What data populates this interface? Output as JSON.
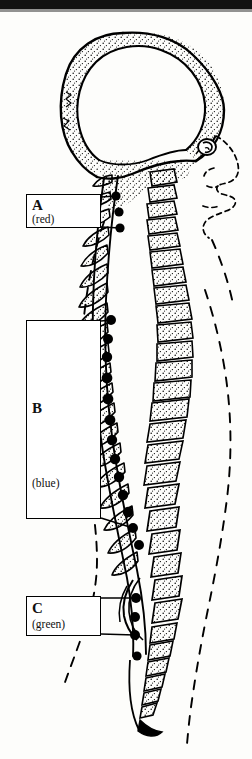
{
  "figure": {
    "kind": "anatomical-line-drawing",
    "view": "lateral / sagittal profile",
    "background_color": "#fdfdfb",
    "ink_color": "#000000"
  },
  "scan_artifact": {
    "name": "top-black-bar",
    "color": "#121212"
  },
  "labels": [
    {
      "id": "A",
      "letter": "A",
      "color_word": "(red)",
      "color_hex": "#cc0000",
      "region": "cervical",
      "box": {
        "x": 26,
        "y": 194,
        "w": 75,
        "h": 34
      },
      "leader_lines": 2,
      "marker_dots": 3
    },
    {
      "id": "B",
      "letter": "B",
      "color_word": "(blue)",
      "color_hex": "#0033cc",
      "region": "thoracic",
      "box": {
        "x": 26,
        "y": 320,
        "w": 75,
        "h": 199
      },
      "leader_lines": 2,
      "marker_dots": 12
    },
    {
      "id": "C",
      "letter": "C",
      "color_word": "(green)",
      "color_hex": "#008000",
      "region": "lumbar",
      "box": {
        "x": 26,
        "y": 596,
        "w": 75,
        "h": 40
      },
      "leader_lines": 2,
      "marker_dots": 3
    }
  ],
  "anatomy_parts": [
    {
      "name": "skull-cranium",
      "style": "stippled double outline"
    },
    {
      "name": "face-profile",
      "style": "dashed outline"
    },
    {
      "name": "ear",
      "style": "solid outline"
    },
    {
      "name": "vertebral-bodies",
      "style": "stippled blocks"
    },
    {
      "name": "spinous-processes",
      "style": "stippled wedges"
    },
    {
      "name": "spinal-cord-canal",
      "style": "pale band"
    },
    {
      "name": "spinal-nerve-dots",
      "style": "filled black circles"
    },
    {
      "name": "sacrum-coccyx",
      "style": "tapering stippled blocks"
    },
    {
      "name": "body-outline-back",
      "style": "dashed line"
    },
    {
      "name": "body-outline-front",
      "style": "dashed line"
    }
  ],
  "spinal_cord_dots": [
    {
      "x": 116,
      "y": 196,
      "r": 4.6
    },
    {
      "x": 119,
      "y": 212,
      "r": 4.6
    },
    {
      "x": 120,
      "y": 228,
      "r": 4.6
    },
    {
      "x": 111,
      "y": 320,
      "r": 5.0
    },
    {
      "x": 108,
      "y": 339,
      "r": 5.0
    },
    {
      "x": 107,
      "y": 357,
      "r": 5.2
    },
    {
      "x": 107,
      "y": 378,
      "r": 5.4
    },
    {
      "x": 108,
      "y": 399,
      "r": 5.4
    },
    {
      "x": 110,
      "y": 420,
      "r": 5.4
    },
    {
      "x": 112,
      "y": 440,
      "r": 5.2
    },
    {
      "x": 115,
      "y": 459,
      "r": 5.2
    },
    {
      "x": 119,
      "y": 477,
      "r": 5.2
    },
    {
      "x": 123,
      "y": 495,
      "r": 5.2
    },
    {
      "x": 128,
      "y": 512,
      "r": 5.2
    },
    {
      "x": 133,
      "y": 528,
      "r": 5.0
    },
    {
      "x": 139,
      "y": 545,
      "r": 5.0
    },
    {
      "x": 136,
      "y": 598,
      "r": 5.0
    },
    {
      "x": 135,
      "y": 617,
      "r": 5.0
    },
    {
      "x": 135,
      "y": 635,
      "r": 5.0
    },
    {
      "x": 137,
      "y": 656,
      "r": 4.6
    }
  ]
}
